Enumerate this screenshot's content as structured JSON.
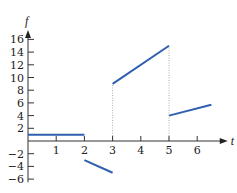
{
  "chart_data": {
    "type": "line",
    "title": "",
    "xlabel": "t",
    "ylabel": "f",
    "xlim": [
      0,
      6.8
    ],
    "ylim": [
      -6.5,
      17.5
    ],
    "xticks": [
      1,
      2,
      3,
      4,
      5,
      6
    ],
    "yticks": [
      -6,
      -4,
      -2,
      2,
      4,
      6,
      8,
      10,
      12,
      14,
      16
    ],
    "grid": false,
    "line_color": "#2f5fb0",
    "series": [
      {
        "name": "segment-1",
        "x": [
          0,
          2
        ],
        "y": [
          1,
          1
        ]
      },
      {
        "name": "segment-2",
        "x": [
          2,
          3
        ],
        "y": [
          -3,
          -5
        ]
      },
      {
        "name": "segment-3",
        "x": [
          3,
          5
        ],
        "y": [
          9,
          15
        ]
      },
      {
        "name": "segment-4",
        "x": [
          5,
          6.5
        ],
        "y": [
          4,
          5.7
        ]
      }
    ],
    "dotted_verticals": [
      {
        "x": 3,
        "y_from": 0,
        "y_to": 9
      },
      {
        "x": 5,
        "y_from": 0,
        "y_to": 15
      }
    ]
  }
}
